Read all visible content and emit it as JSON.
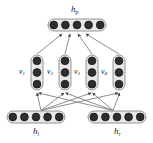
{
  "figure": {
    "type": "neural-network-tree-diagram",
    "title": "",
    "background_color": "#ffffff",
    "node_fill_color": "#2e2e2e",
    "node_stroke_color": "#111111",
    "group_fill_color": "#e8e8e8",
    "group_stroke_color": "#8a8a8a",
    "edge_color": "#6f6f6f",
    "label_color": "#1a1a1a"
  },
  "nodes": {
    "parent": {
      "id": "h_p",
      "label_base": "h",
      "label_sub": "p",
      "orientation": "horizontal",
      "unit_count": 5,
      "x": 48,
      "y": 19,
      "width": 58,
      "height": 12,
      "label_x": 71,
      "label_y": 5
    },
    "children": [
      {
        "id": "v_1",
        "label_base": "v",
        "label_sub": "1",
        "orientation": "vertical",
        "unit_count": 3,
        "x": 31,
        "y": 55,
        "width": 12,
        "height": 35,
        "label_x": 19,
        "label_y": 68
      },
      {
        "id": "v_2",
        "label_base": "v",
        "label_sub": "2",
        "orientation": "vertical",
        "unit_count": 3,
        "x": 59,
        "y": 55,
        "width": 12,
        "height": 35,
        "label_x": 47,
        "label_y": 68
      },
      {
        "id": "v_3",
        "label_base": "v",
        "label_sub": "3",
        "orientation": "vertical",
        "unit_count": 3,
        "x": 86,
        "y": 55,
        "width": 12,
        "height": 35,
        "label_x": 74,
        "label_y": 68
      },
      {
        "id": "v_4",
        "label_base": "v",
        "label_sub": "4",
        "orientation": "vertical",
        "unit_count": 3,
        "x": 113,
        "y": 55,
        "width": 12,
        "height": 35,
        "label_x": 101,
        "label_y": 68
      }
    ],
    "leaves": [
      {
        "id": "h_l",
        "label_base": "h",
        "label_sub": "l",
        "orientation": "horizontal",
        "unit_count": 5,
        "x": 7,
        "y": 111,
        "width": 58,
        "height": 12,
        "label_x": 33,
        "label_y": 127
      },
      {
        "id": "h_r",
        "label_base": "h",
        "label_sub": "r",
        "orientation": "horizontal",
        "unit_count": 5,
        "x": 88,
        "y": 111,
        "width": 58,
        "height": 12,
        "label_x": 114,
        "label_y": 127
      }
    ]
  },
  "edges": {
    "children_to_parent": [
      {
        "from": "v_1",
        "to": "h_p"
      },
      {
        "from": "v_2",
        "to": "h_p"
      },
      {
        "from": "v_3",
        "to": "h_p"
      },
      {
        "from": "v_4",
        "to": "h_p"
      }
    ],
    "leaves_to_children": [
      {
        "from": "h_l",
        "to": "v_1"
      },
      {
        "from": "h_l",
        "to": "v_2"
      },
      {
        "from": "h_l",
        "to": "v_3"
      },
      {
        "from": "h_l",
        "to": "v_4"
      },
      {
        "from": "h_r",
        "to": "v_1"
      },
      {
        "from": "h_r",
        "to": "v_2"
      },
      {
        "from": "h_r",
        "to": "v_3"
      },
      {
        "from": "h_r",
        "to": "v_4"
      }
    ]
  }
}
